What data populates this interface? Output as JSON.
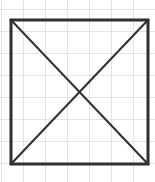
{
  "figure": {
    "canvas": {
      "width": 155,
      "height": 182,
      "background": "#ffffff"
    },
    "grid": {
      "visible": true,
      "line_color": "#e3e3e6",
      "line_width": 1,
      "spacing_x": 22,
      "spacing_y": 22,
      "origin_x": 1,
      "origin_y": 9,
      "vertical_lines": [
        1,
        23,
        45,
        67,
        89,
        111,
        133,
        155
      ],
      "horizontal_lines": [
        9,
        31,
        53,
        75,
        97,
        119,
        141,
        163
      ]
    },
    "shapes": [
      {
        "name": "square-outline",
        "type": "rect",
        "stroke": "#2e2e33",
        "stroke_width": 3,
        "fill": "none",
        "x": 11,
        "y": 20,
        "width": 137,
        "height": 144,
        "corners": {
          "top_left": [
            11,
            20
          ],
          "top_right": [
            148,
            20
          ],
          "bottom_right": [
            148,
            164
          ],
          "bottom_left": [
            11,
            164
          ]
        }
      },
      {
        "name": "diagonal-top-left-to-bottom-right",
        "type": "line",
        "stroke": "#2e2e33",
        "stroke_width": 2,
        "x1": 11,
        "y1": 20,
        "x2": 148,
        "y2": 164
      },
      {
        "name": "diagonal-bottom-left-to-top-right",
        "type": "line",
        "stroke": "#2e2e33",
        "stroke_width": 2,
        "x1": 11,
        "y1": 164,
        "x2": 148,
        "y2": 20
      }
    ],
    "intersection_point": {
      "name": "diagonal-intersection",
      "x": 79.5,
      "y": 92
    },
    "labels": []
  }
}
